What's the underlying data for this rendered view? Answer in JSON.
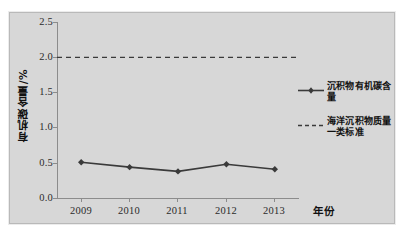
{
  "chart_data": {
    "type": "line",
    "title": "",
    "xlabel": "年份",
    "ylabel": "有机碳含量/%",
    "categories": [
      "2009",
      "2010",
      "2011",
      "2012",
      "2013"
    ],
    "ylim": [
      0.0,
      2.5
    ],
    "yticks": [
      "0.0",
      "0.5",
      "1.0",
      "1.5",
      "2.0",
      "2.5"
    ],
    "ytick_values": [
      0.0,
      0.5,
      1.0,
      1.5,
      2.0,
      2.5
    ],
    "grid": false,
    "legend_position": "right",
    "series": [
      {
        "name": "沉积物有机碳含量",
        "style": "solid-marker",
        "marker": "diamond",
        "color": "#3a3a3a",
        "values": [
          0.52,
          0.45,
          0.39,
          0.49,
          0.42
        ]
      },
      {
        "name": "海洋沉积物质量一类标准",
        "style": "dashed",
        "marker": "none",
        "color": "#3a3a3a",
        "constant_value": 2.0,
        "values": [
          2.0,
          2.0,
          2.0,
          2.0,
          2.0
        ]
      }
    ],
    "colors": {
      "plot_background": "#d7d7d7",
      "axis": "#8c8c8c",
      "series_line": "#3a3a3a",
      "text": "#111111"
    }
  },
  "legend": {
    "entries": [
      {
        "label": "沉积物有机碳含量"
      },
      {
        "label": "海洋沉积物质量一类标准"
      }
    ]
  }
}
